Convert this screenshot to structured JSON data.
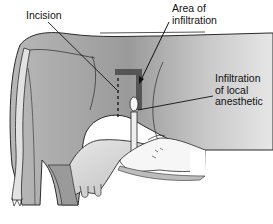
{
  "figure": {
    "labels": {
      "incision": "Incision",
      "area_line1": "Area of",
      "area_line2": "infiltration",
      "infil_line1": "Infiltration",
      "infil_line2": "of local",
      "infil_line3": "anesthetic"
    },
    "colors": {
      "body_dark": "#8c8c8c",
      "body_light": "#d6d6d6",
      "udder": "#c8c8c8",
      "block": "#5a5a5a",
      "outline": "#2a2a2a",
      "hand": "#f4f4f4"
    }
  }
}
